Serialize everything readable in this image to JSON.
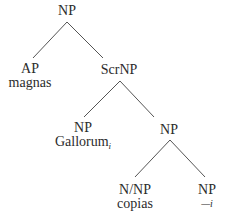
{
  "tree": {
    "root": {
      "category": "NP"
    },
    "ap": {
      "category": "AP",
      "word": "magnas"
    },
    "scrnp": {
      "category": "ScrNP"
    },
    "np_gallorum": {
      "category": "NP",
      "word": "Gallorum",
      "index": "i"
    },
    "np_inner": {
      "category": "NP"
    },
    "n_np": {
      "category": "N/NP",
      "word": "copias"
    },
    "np_trace": {
      "category": "NP",
      "trace": "—",
      "index": "i"
    }
  },
  "edges": [
    {
      "from": "root",
      "to": "ap"
    },
    {
      "from": "root",
      "to": "scrnp"
    },
    {
      "from": "scrnp",
      "to": "np_gallorum"
    },
    {
      "from": "scrnp",
      "to": "np_inner"
    },
    {
      "from": "np_inner",
      "to": "n_np"
    },
    {
      "from": "np_inner",
      "to": "np_trace"
    }
  ],
  "colors": {
    "text": "#2b2b2b",
    "edge": "#555555",
    "background": "#ffffff"
  }
}
